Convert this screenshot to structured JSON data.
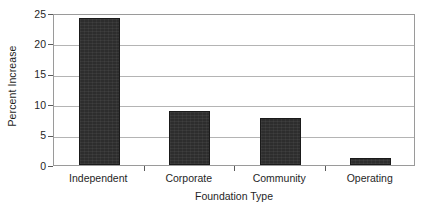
{
  "chart_data": {
    "type": "bar",
    "title": "",
    "subtitle": "",
    "xlabel": "Foundation Type",
    "ylabel": "Percent Increase",
    "categories": [
      "Independent",
      "Corporate",
      "Community",
      "Operating"
    ],
    "values": [
      24.1,
      8.9,
      7.7,
      1.2
    ],
    "ylim": [
      0,
      25
    ],
    "ytick_values": [
      0,
      5,
      10,
      15,
      20,
      25
    ],
    "ytick_labels": [
      "0",
      "5",
      "10",
      "15",
      "20",
      "25"
    ],
    "grid": "horizontal",
    "legend": "none",
    "bar_color": "#2d2d2d",
    "grid_color": "#b4b4b4",
    "axis_color": "#9a9a9a",
    "background_color": "#ffffff"
  }
}
